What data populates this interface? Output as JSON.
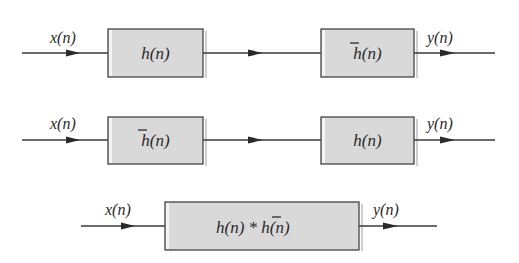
{
  "diagram": {
    "type": "block-diagram",
    "rows": [
      {
        "input_label": "x(n)",
        "output_label": "y(n)",
        "blocks": [
          {
            "label": "h(n)",
            "bar": false
          },
          {
            "label": "h(n)",
            "bar": true
          }
        ]
      },
      {
        "input_label": "x(n)",
        "output_label": "y(n)",
        "blocks": [
          {
            "label": "h(n)",
            "bar": true
          },
          {
            "label": "h(n)",
            "bar": false
          }
        ]
      },
      {
        "input_label": "x(n)",
        "output_label": "y(n)",
        "blocks": [
          {
            "label_left": "h(n) * ",
            "label_right": "h(n)",
            "bar_right": true
          }
        ]
      }
    ]
  },
  "colors": {
    "box_fill": "#d9d9d9",
    "box_border": "#444444",
    "line": "#3a3a3a",
    "text": "#2a2a2a"
  }
}
